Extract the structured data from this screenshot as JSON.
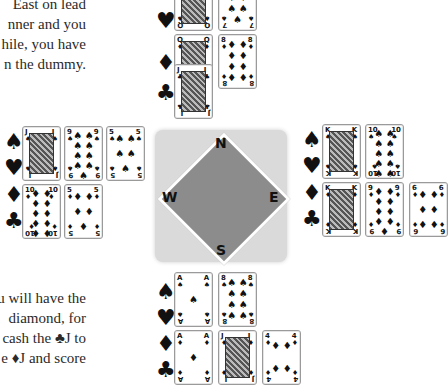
{
  "text": {
    "top_lines": [
      "East on lead",
      "nner and you",
      "hile, you have",
      "n the dummy."
    ],
    "bottom_lines": [
      "u will have the",
      "diamond,  for",
      "cash the ♣J to",
      "e ♦J and score"
    ]
  },
  "suits": {
    "spades": "♠",
    "hearts": "♥",
    "diamonds": "♦",
    "clubs": "♣"
  },
  "compass": {
    "north": "N",
    "south": "S",
    "east": "E",
    "west": "W",
    "colors": {
      "box": "#dadada",
      "diamond": "#8c8c8c",
      "border": "#ffffff"
    }
  },
  "hands": {
    "north": {
      "spades": [
        {
          "rank": "Q",
          "suit": "♠",
          "face": true
        },
        {
          "rank": "7",
          "suit": "♠",
          "pips": 7
        }
      ],
      "hearts": [],
      "diamonds": [
        {
          "rank": "Q",
          "suit": "♦",
          "face": true
        },
        {
          "rank": "8",
          "suit": "♦",
          "pips": 8
        }
      ],
      "clubs": [
        {
          "rank": "J",
          "suit": "♣",
          "face": true
        }
      ]
    },
    "west": {
      "spades": [
        {
          "rank": "J",
          "suit": "♠",
          "face": true
        },
        {
          "rank": "9",
          "suit": "♠",
          "pips": 9
        },
        {
          "rank": "5",
          "suit": "♠",
          "pips": 5
        }
      ],
      "hearts": [],
      "diamonds": [
        {
          "rank": "10",
          "suit": "♦",
          "pips": 10
        },
        {
          "rank": "5",
          "suit": "♦",
          "pips": 5
        }
      ],
      "clubs": []
    },
    "east": {
      "spades": [
        {
          "rank": "K",
          "suit": "♠",
          "face": true
        },
        {
          "rank": "10",
          "suit": "♠",
          "pips": 10
        }
      ],
      "hearts": [],
      "diamonds": [
        {
          "rank": "K",
          "suit": "♦",
          "face": true
        },
        {
          "rank": "9",
          "suit": "♦",
          "pips": 9
        },
        {
          "rank": "6",
          "suit": "♦",
          "pips": 6
        }
      ],
      "clubs": []
    },
    "south": {
      "spades": [
        {
          "rank": "A",
          "suit": "♠",
          "pips": 1
        },
        {
          "rank": "8",
          "suit": "♠",
          "pips": 8
        }
      ],
      "hearts": [],
      "diamonds": [
        {
          "rank": "A",
          "suit": "♦",
          "pips": 1
        },
        {
          "rank": "J",
          "suit": "♦",
          "face": true
        },
        {
          "rank": "4",
          "suit": "♦",
          "pips": 4
        }
      ],
      "clubs": []
    }
  }
}
